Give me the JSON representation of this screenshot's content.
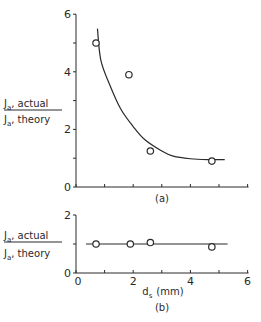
{
  "chart_data": [
    {
      "panel": "(a)",
      "type": "scatter",
      "title": "",
      "xlabel": "",
      "ylabel": "Ja, actual / Ja, theory",
      "ylabel_numerator": "J",
      "ylabel_numerator_sub": "a",
      "ylabel_numerator_rest": ", actual",
      "ylabel_denominator": "J",
      "ylabel_denominator_sub": "a",
      "ylabel_denominator_rest": ", theory",
      "xlim": [
        0,
        6
      ],
      "ylim": [
        0,
        6
      ],
      "yticks": [
        "0",
        "2",
        "4",
        "6"
      ],
      "caption": "(a)",
      "grid": false,
      "points": [
        {
          "x": 0.7,
          "y": 5.0
        },
        {
          "x": 1.85,
          "y": 3.9
        },
        {
          "x": 2.6,
          "y": 1.25
        },
        {
          "x": 4.75,
          "y": 0.9
        }
      ],
      "fit_curve": [
        {
          "x": 0.75,
          "y": 5.5
        },
        {
          "x": 0.87,
          "y": 4.4
        },
        {
          "x": 1.2,
          "y": 3.5
        },
        {
          "x": 1.57,
          "y": 2.7
        },
        {
          "x": 2.0,
          "y": 2.1
        },
        {
          "x": 2.4,
          "y": 1.65
        },
        {
          "x": 3.0,
          "y": 1.25
        },
        {
          "x": 3.4,
          "y": 1.07
        },
        {
          "x": 4.0,
          "y": 0.98
        },
        {
          "x": 4.6,
          "y": 0.95
        },
        {
          "x": 5.2,
          "y": 0.95
        }
      ]
    },
    {
      "panel": "(b)",
      "type": "scatter",
      "title": "",
      "xlabel": "ds (mm)",
      "xlabel_main": "d",
      "xlabel_sub": "s",
      "xlabel_rest": "(mm)",
      "ylabel": "Ja, actual / Ja, theory",
      "ylabel_numerator": "J",
      "ylabel_numerator_sub": "a",
      "ylabel_numerator_rest": ", actual",
      "ylabel_denominator": "J",
      "ylabel_denominator_sub": "a",
      "ylabel_denominator_rest": ", theory",
      "xlim": [
        0,
        6
      ],
      "ylim": [
        0,
        2
      ],
      "xticks": [
        "0",
        "2",
        "4",
        "6"
      ],
      "yticks": [
        "0",
        "2"
      ],
      "caption": "(b)",
      "grid": false,
      "points": [
        {
          "x": 0.7,
          "y": 1.0
        },
        {
          "x": 1.9,
          "y": 1.0
        },
        {
          "x": 2.6,
          "y": 1.05
        },
        {
          "x": 4.75,
          "y": 0.9
        }
      ],
      "fit_line": [
        {
          "x": 0.35,
          "y": 1.0
        },
        {
          "x": 5.3,
          "y": 1.0
        }
      ]
    }
  ],
  "colors": {
    "ink": "#2a2a2a",
    "background": "#ffffff"
  }
}
